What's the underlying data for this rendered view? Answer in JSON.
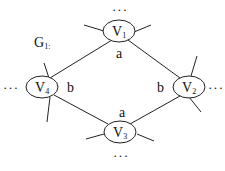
{
  "graph": {
    "title": "G",
    "title_sub": "1:",
    "nodes": [
      {
        "id": "v1",
        "label": "V",
        "sub": "1"
      },
      {
        "id": "v2",
        "label": "V",
        "sub": "2"
      },
      {
        "id": "v3",
        "label": "V",
        "sub": "3"
      },
      {
        "id": "v4",
        "label": "V",
        "sub": "4"
      }
    ],
    "edges": [
      {
        "from": "v1",
        "to": "v2",
        "label": "a"
      },
      {
        "from": "v1",
        "to": "v4",
        "label": ""
      },
      {
        "from": "v4",
        "to": "v3",
        "label": "b"
      },
      {
        "from": "v2",
        "to": "v3",
        "label": "b"
      }
    ],
    "edge_labels": {
      "v1_a": "a",
      "v4_b": "b",
      "v2_b": "b",
      "v3_a": "a"
    },
    "ellipsis": "···"
  }
}
